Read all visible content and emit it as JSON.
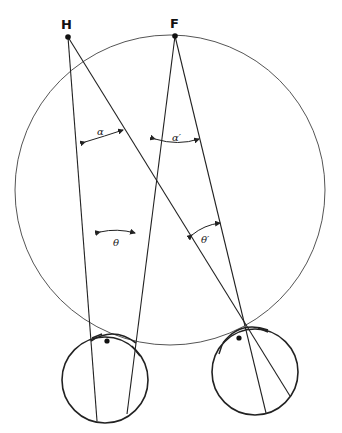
{
  "diagram": {
    "type": "binocular-geometry",
    "points": {
      "H": {
        "label": "H",
        "x": 68,
        "y": 37
      },
      "F": {
        "label": "F",
        "x": 175,
        "y": 36
      }
    },
    "vieth_muller_circle": {
      "cx": 170,
      "cy": 190,
      "r": 155
    },
    "eyes": [
      {
        "name": "left-eye",
        "cx": 105,
        "cy": 380,
        "r": 43,
        "nodal": {
          "x": 114,
          "y": 332
        },
        "label": "e"
      },
      {
        "name": "right-eye",
        "cx": 255,
        "cy": 372,
        "r": 43,
        "nodal": {
          "x": 244,
          "y": 322
        },
        "label": ""
      }
    ],
    "angles": {
      "alpha": "α",
      "alpha_prime": "α′",
      "theta": "θ",
      "theta_prime": "θ′"
    },
    "colors": {
      "line": "#222222",
      "circle": "#555555"
    }
  }
}
